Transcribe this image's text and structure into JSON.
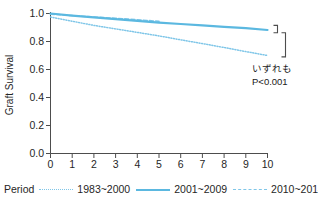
{
  "chart_data": {
    "type": "line",
    "title": "",
    "xlabel": "year",
    "ylabel": "Graft Survival",
    "xlim": [
      0,
      10
    ],
    "ylim": [
      0.0,
      1.0
    ],
    "xticks": [
      "0",
      "1",
      "2",
      "3",
      "4",
      "5",
      "6",
      "7",
      "8",
      "9",
      "10"
    ],
    "yticks": [
      "0.0",
      "0.2",
      "0.4",
      "0.6",
      "0.8",
      "1.0"
    ],
    "grid": false,
    "legend_position": "below",
    "legend_title": "Period",
    "series": [
      {
        "name": "1983~2000",
        "style": "dotted",
        "color": "#7fc6e8",
        "x": [
          0,
          1,
          2,
          3,
          4,
          5,
          6,
          7,
          8,
          9,
          10
        ],
        "values": [
          0.975,
          0.945,
          0.915,
          0.89,
          0.865,
          0.84,
          0.812,
          0.785,
          0.757,
          0.728,
          0.7
        ]
      },
      {
        "name": "2001~2009",
        "style": "solid",
        "color": "#5bb8e0",
        "x": [
          0,
          1,
          2,
          3,
          4,
          5,
          6,
          7,
          8,
          9,
          10
        ],
        "values": [
          1.0,
          0.985,
          0.972,
          0.96,
          0.948,
          0.935,
          0.925,
          0.915,
          0.905,
          0.895,
          0.882
        ]
      },
      {
        "name": "2010~2014",
        "style": "dashed",
        "color": "#7fc6e8",
        "x": [
          0,
          1,
          2,
          3,
          4,
          5
        ],
        "values": [
          0.995,
          0.985,
          0.975,
          0.966,
          0.956,
          0.944
        ]
      }
    ],
    "annotations": [
      {
        "id": "significance-note-line1",
        "text": "いずれも"
      },
      {
        "id": "significance-note-line2",
        "text": "P<0.001"
      }
    ],
    "brackets": [
      {
        "id": "bracket-upper",
        "y_top": 0.915,
        "y_bottom": 0.862
      },
      {
        "id": "bracket-lower",
        "y_top": 0.862,
        "y_bottom": 0.69
      }
    ]
  },
  "colors": {
    "series_solid": "#5bb8e0",
    "series_dotted": "#7fc6e8",
    "axis": "#4d4d4d",
    "text": "#262626",
    "background": "#ffffff"
  }
}
